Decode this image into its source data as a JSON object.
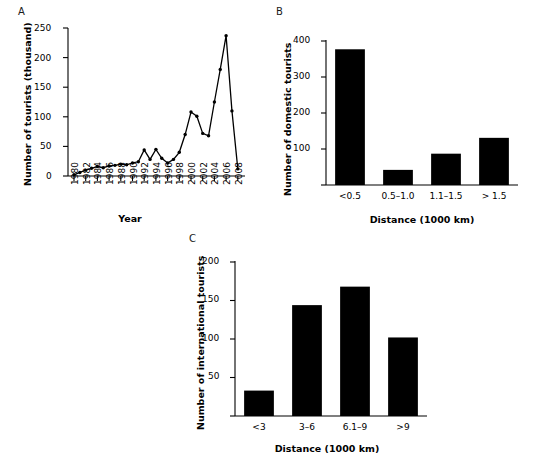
{
  "figure": {
    "panels": [
      {
        "letter": "A",
        "chart_data": {
          "type": "line",
          "title": "",
          "xlabel": "Year",
          "ylabel": "Number of tourists (thousand)",
          "xlim": [
            1979,
            2009
          ],
          "ylim": [
            0,
            250
          ],
          "yticks": [
            0,
            50,
            100,
            150,
            200,
            250
          ],
          "xticks": [
            1980,
            1982,
            1984,
            1986,
            1988,
            1990,
            1992,
            1994,
            1996,
            1998,
            2000,
            2002,
            2004,
            2006,
            2008
          ],
          "grid": false,
          "markers": "filled-circle",
          "x": [
            1980,
            1981,
            1982,
            1983,
            1984,
            1985,
            1986,
            1987,
            1988,
            1989,
            1990,
            1991,
            1992,
            1993,
            1994,
            1995,
            1996,
            1997,
            1998,
            1999,
            2000,
            2001,
            2002,
            2003,
            2004,
            2005,
            2006,
            2007,
            2008
          ],
          "values": [
            2,
            6,
            10,
            13,
            16,
            14,
            17,
            18,
            20,
            19,
            22,
            24,
            44,
            28,
            45,
            30,
            22,
            28,
            40,
            70,
            108,
            101,
            72,
            68,
            125,
            180,
            237,
            110,
            12
          ]
        }
      },
      {
        "letter": "B",
        "chart_data": {
          "type": "bar",
          "title": "",
          "xlabel": "Distance (1000 km)",
          "ylabel": "Number of domestic tourists",
          "categories": [
            "<0.5",
            "0.5–1.0",
            "1.1–1.5",
            "> 1.5"
          ],
          "values": [
            377,
            42,
            87,
            131
          ],
          "ylim": [
            0,
            400
          ],
          "yticks": [
            0,
            100,
            200,
            300,
            400
          ],
          "grid": false,
          "bar_color": "#000000"
        }
      },
      {
        "letter": "C",
        "chart_data": {
          "type": "bar",
          "title": "",
          "xlabel": "Distance (1000 km)",
          "ylabel": "Number of international tourists",
          "categories": [
            "<3",
            "3–6",
            "6.1–9",
            ">9"
          ],
          "values": [
            33,
            144,
            168,
            102
          ],
          "ylim": [
            0,
            200
          ],
          "yticks": [
            0,
            50,
            100,
            150,
            200
          ],
          "grid": false,
          "bar_color": "#000000"
        }
      }
    ]
  }
}
